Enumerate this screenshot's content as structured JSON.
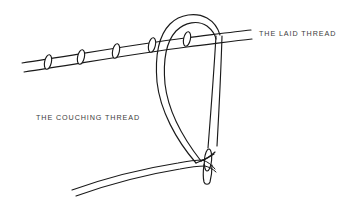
{
  "figure": {
    "background_color": "#ffffff",
    "ink_color": "#1a1a1a",
    "label_color": "#3c3c3c",
    "width": 348,
    "height": 208
  },
  "labels": {
    "laid_thread": "THE LAID THREAD",
    "couching_thread": "THE COUCHING THREAD"
  },
  "parts": {
    "laid_thread_name": "laid-thread",
    "couching_thread_name": "couching-thread",
    "needle_name": "needle",
    "needle_eye_name": "needle-eye",
    "loop_name": "couching-thread-loop",
    "stitch_name": "couching-stitch"
  },
  "couching_stitch_count": 5
}
